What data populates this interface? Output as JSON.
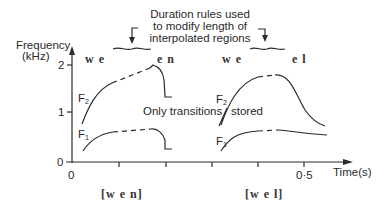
{
  "annotation": {
    "line1": "Duration rules used",
    "line2": "to modify length of",
    "line3": "interpolated regions"
  },
  "axes": {
    "y_label_line1": "Frequency",
    "y_label_line2": "(kHz)",
    "y_ticks": [
      "0",
      "1",
      "2"
    ],
    "x_label": "Time(s)",
    "x_tick_labels": {
      "origin": "0",
      "half": "0·5"
    }
  },
  "segments": {
    "left_start": "w e",
    "left_end": "e n",
    "right_start": "w e",
    "right_end": "e l"
  },
  "formants": {
    "f2_left": "F",
    "f2_left_sub": "2",
    "f1_left": "F",
    "f1_left_sub": "1",
    "f2_right": "F",
    "f2_right_sub": "2",
    "f1_right": "F",
    "f1_right_sub": "1"
  },
  "middle_label": {
    "part1": "Only transitions",
    "part2": "stored"
  },
  "words": {
    "left": "[w e n]",
    "right": "[w e l]"
  }
}
